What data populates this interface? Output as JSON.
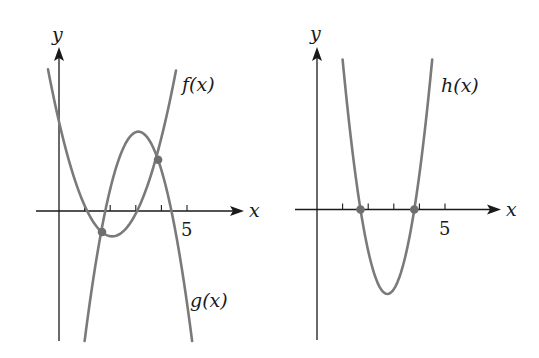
{
  "chart_data": [
    {
      "type": "line",
      "title": "",
      "xlabel": "x",
      "ylabel": "y",
      "x_tick_labels": [
        {
          "x": 5,
          "label": "5"
        }
      ],
      "x_ticks": [
        1,
        2,
        3,
        4,
        5
      ],
      "xlim": [
        -0.9,
        7.2
      ],
      "ylim": [
        -5.1,
        6.4
      ],
      "grid": false,
      "series": [
        {
          "name": "f(x)",
          "label": "f(x)",
          "kind": "parabola",
          "a": 1.04,
          "h": 2.075,
          "k": -0.99,
          "x_range": [
            -0.43,
            4.57
          ],
          "description": "upward-opening parabola, roots near x=1.1 and x=3.05, vertex near (2.1, -1.0), y-intercept near 3.5"
        },
        {
          "name": "g(x)",
          "label": "g(x)",
          "kind": "parabola",
          "a": -1.855,
          "h": 3.1,
          "k": 3.1,
          "x_range": [
            1.0,
            5.2
          ],
          "description": "downward-opening parabola, vertex near (3.1, 3.1)"
        }
      ],
      "points": [
        {
          "x": 1.68,
          "y": -0.82,
          "note": "intersection of f and g"
        },
        {
          "x": 3.87,
          "y": 2.0,
          "note": "intersection of f and g"
        }
      ],
      "labels": {
        "f": "f(x)",
        "g": "g(x)",
        "x": "x",
        "y": "y",
        "five": "5"
      }
    },
    {
      "type": "line",
      "title": "",
      "xlabel": "x",
      "ylabel": "y",
      "x_tick_labels": [
        {
          "x": 5,
          "label": "5"
        }
      ],
      "x_ticks": [
        1,
        2,
        3,
        4,
        5
      ],
      "xlim": [
        -0.9,
        7.2
      ],
      "ylim": [
        -5.1,
        6.4
      ],
      "grid": false,
      "series": [
        {
          "name": "h(x)",
          "label": "h(x)",
          "kind": "parabola",
          "a": 2.99,
          "h": 2.75,
          "k": -3.3,
          "x_range": [
            1.0,
            4.5
          ],
          "description": "upward-opening parabola, roots near x=1.7 and x=3.8, vertex near (2.75, -3.3)"
        }
      ],
      "points": [
        {
          "x": 1.7,
          "y": 0,
          "note": "x-intercept of h"
        },
        {
          "x": 3.8,
          "y": 0,
          "note": "x-intercept of h"
        }
      ],
      "labels": {
        "h": "h(x)",
        "x": "x",
        "y": "y",
        "five": "5"
      }
    }
  ],
  "layout": {
    "unit_px": 25.6,
    "left_origin": [
      59,
      211
    ],
    "right_origin": [
      317,
      209.5
    ]
  }
}
